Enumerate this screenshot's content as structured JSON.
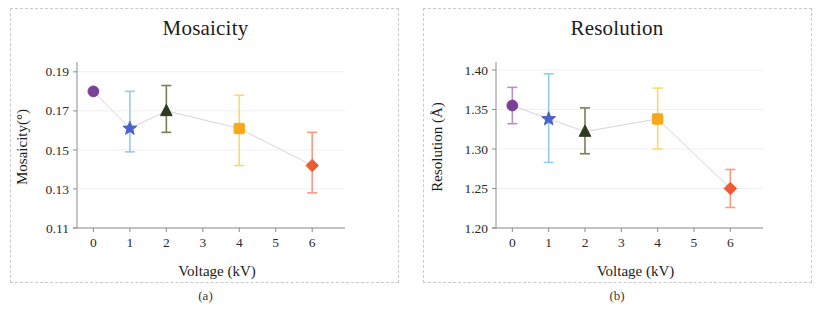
{
  "figure": {
    "panels": [
      {
        "id": "panel-a",
        "caption": "(a)",
        "title": "Mosaicity"
      },
      {
        "id": "panel-b",
        "caption": "(b)",
        "title": "Resolution"
      }
    ]
  },
  "colors": {
    "purple": "#7B3F98",
    "blue": "#4A63C8",
    "blue_err": "#93CDEE",
    "green": "#2F3B1E",
    "green_err": "#7A7F55",
    "yellow": "#F7A81B",
    "yellow_err": "#FAD96B",
    "red": "#F15A33",
    "red_err": "#F79B83",
    "axis": "#8C8C8C",
    "text": "#1C1C1C",
    "trend": "#D9D2DD",
    "frame": "#C9C9C9"
  },
  "chart_data": [
    {
      "type": "scatter",
      "title": "Mosaicity",
      "caption": "(a)",
      "xlabel": "Voltage (kV)",
      "ylabel": "Mosaicity(°)",
      "xlim": [
        -0.45,
        6.9
      ],
      "ylim": [
        0.11,
        0.193
      ],
      "xticks": [
        0,
        1,
        2,
        3,
        4,
        5,
        6
      ],
      "xticklabels": [
        "0",
        "1",
        "2",
        "3",
        "4",
        "5",
        "6"
      ],
      "yticks": [
        0.11,
        0.13,
        0.15,
        0.17,
        0.19
      ],
      "yticklabels": [
        "0.11",
        "0.13",
        "0.15",
        "0.17",
        "0.19"
      ],
      "grid": true,
      "legend": "none",
      "x": [
        0,
        1,
        2,
        4,
        6
      ],
      "values": [
        0.18,
        0.161,
        0.17,
        0.161,
        0.142
      ],
      "err_low": [
        0.18,
        0.149,
        0.159,
        0.142,
        0.128
      ],
      "err_high": [
        0.18,
        0.18,
        0.183,
        0.178,
        0.159
      ],
      "markers": [
        "circle",
        "star",
        "triangle",
        "square",
        "diamond"
      ],
      "marker_colors": [
        "#7B3F98",
        "#4A63C8",
        "#2F3B1E",
        "#F7A81B",
        "#F15A33"
      ],
      "err_colors": [
        "#B98FC4",
        "#93CDEE",
        "#7A7F55",
        "#FAD96B",
        "#F79B83"
      ],
      "trend_on": true
    },
    {
      "type": "scatter",
      "title": "Resolution",
      "caption": "(b)",
      "xlabel": "Voltage (kV)",
      "ylabel": "Resolution (Å)",
      "xlim": [
        -0.45,
        6.9
      ],
      "ylim": [
        1.2,
        1.405
      ],
      "xticks": [
        0,
        1,
        2,
        3,
        4,
        5,
        6
      ],
      "xticklabels": [
        "0",
        "1",
        "2",
        "3",
        "4",
        "5",
        "6"
      ],
      "yticks": [
        1.2,
        1.25,
        1.3,
        1.35,
        1.4
      ],
      "yticklabels": [
        "1.20",
        "1.25",
        "1.30",
        "1.35",
        "1.40"
      ],
      "grid": true,
      "legend": "none",
      "x": [
        0,
        1,
        2,
        4,
        6
      ],
      "values": [
        1.355,
        1.338,
        1.322,
        1.338,
        1.25
      ],
      "err_low": [
        1.332,
        1.283,
        1.294,
        1.3,
        1.226
      ],
      "err_high": [
        1.378,
        1.395,
        1.352,
        1.377,
        1.274
      ],
      "markers": [
        "circle",
        "star",
        "triangle",
        "square",
        "diamond"
      ],
      "marker_colors": [
        "#7B3F98",
        "#4A63C8",
        "#2F3B1E",
        "#F7A81B",
        "#F15A33"
      ],
      "err_colors": [
        "#B98FC4",
        "#93CDEE",
        "#7A7F55",
        "#FAD96B",
        "#F79B83"
      ],
      "trend_on": true
    }
  ]
}
